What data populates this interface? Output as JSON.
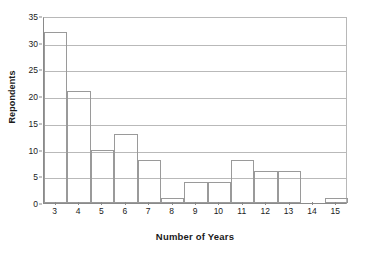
{
  "chart_data": {
    "type": "bar",
    "title": "",
    "subtitle": "",
    "xlabel": "Number of Years",
    "ylabel": "Repondents",
    "categories": [
      "3",
      "4",
      "5",
      "6",
      "7",
      "8",
      "9",
      "10",
      "11",
      "12",
      "13",
      "14",
      "15"
    ],
    "values": [
      32,
      21,
      10,
      13,
      8,
      1,
      4,
      4,
      8,
      6,
      6,
      0,
      1
    ],
    "ylim": [
      0,
      35
    ],
    "ytick_labels": [
      "0",
      "5",
      "10",
      "15",
      "20",
      "25",
      "30",
      "35"
    ],
    "ytick_values": [
      0,
      5,
      10,
      15,
      20,
      25,
      30,
      35
    ],
    "ytick_interval": 5,
    "xtick_labels": [
      "3",
      "4",
      "5",
      "6",
      "7",
      "8",
      "9",
      "10",
      "11",
      "12",
      "13",
      "14",
      "15"
    ],
    "grid": true,
    "grid_axis": "y",
    "legend": false,
    "legend_position": "none",
    "bar_fill_color": "#ffffff",
    "bar_edge_color": "#9a9a9a",
    "gridline_color": "#b9b9b9",
    "axis_color": "#8a8a8a",
    "text_color": "#1a1a1a",
    "background_color": "#ffffff",
    "annotations": []
  }
}
